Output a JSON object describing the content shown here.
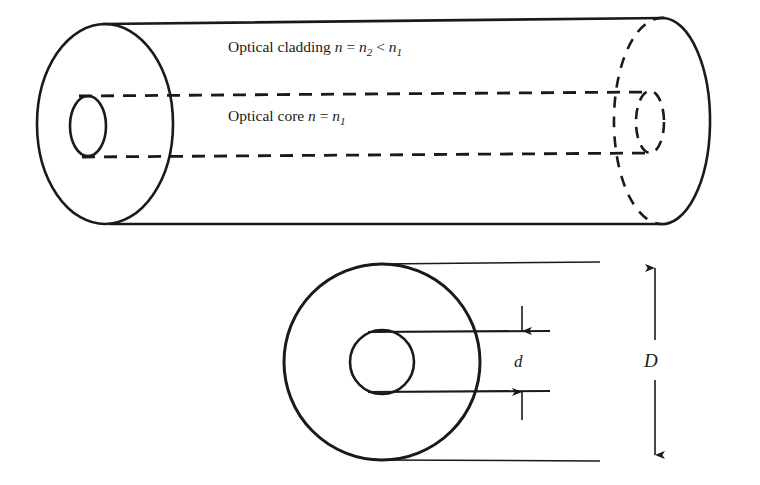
{
  "figure": {
    "stroke_color": "#1a1a1a",
    "background_color": "#ffffff",
    "labels": {
      "cladding": {
        "text_plain": "Optical cladding n = n2 < n1",
        "prefix": "Optical cladding ",
        "var1": "n",
        "eq": " = ",
        "var2": "n",
        "sub2": "2",
        "lt": " < ",
        "var3": "n",
        "sub3": "1"
      },
      "core": {
        "text_plain": "Optical core n = n1",
        "prefix": "Optical core ",
        "var1": "n",
        "eq": " = ",
        "var2": "n",
        "sub2": "1"
      },
      "core_diameter": "d",
      "cladding_diameter": "D"
    }
  },
  "geometry": {
    "cylinder": {
      "left_ellipse": {
        "cx": 105,
        "cy": 124,
        "rx": 68,
        "ry": 100
      },
      "right_ellipse": {
        "cx": 665,
        "cy": 121,
        "rx": 48,
        "ry": 103
      },
      "core_left_ellipse": {
        "cx": 88,
        "cy": 126,
        "rx": 18,
        "ry": 30
      },
      "core_right_ellipse": {
        "cx": 650,
        "cy": 122,
        "rx": 14,
        "ry": 31
      },
      "core_line_top_y": 96,
      "core_line_bottom_y": 157
    },
    "cross_section": {
      "outer_circle": {
        "cx": 382,
        "cy": 362,
        "r": 98
      },
      "inner_circle": {
        "cx": 382,
        "cy": 362,
        "r": 32
      },
      "extension_top_y": 264,
      "extension_bottom_y": 460,
      "core_ext_top_y": 332,
      "core_ext_bottom_y": 392,
      "d_arrow_x": 522,
      "D_arrow_x": 655
    }
  }
}
